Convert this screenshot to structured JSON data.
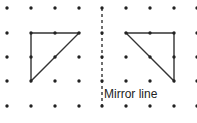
{
  "diagram": {
    "type": "reflection on dot grid",
    "grid": {
      "cols_x": [
        7,
        31,
        55,
        79,
        102,
        126,
        150,
        174,
        197
      ],
      "rows_y": [
        8,
        33,
        57,
        81,
        106
      ],
      "dot_color": "#222222"
    },
    "mirror": {
      "x": 102,
      "y1": 8,
      "y2": 106,
      "style": "dashed",
      "label": "Mirror line",
      "label_x": 104,
      "label_y": 88
    },
    "shapes": [
      {
        "name": "original-triangle",
        "points": [
          [
            31,
            33
          ],
          [
            79,
            33
          ],
          [
            31,
            81
          ]
        ]
      },
      {
        "name": "reflected-triangle",
        "points": [
          [
            126,
            33
          ],
          [
            174,
            33
          ],
          [
            174,
            81
          ]
        ]
      }
    ]
  }
}
